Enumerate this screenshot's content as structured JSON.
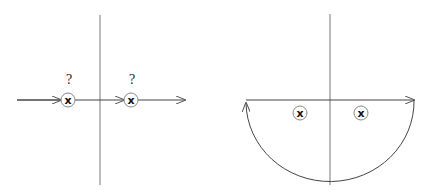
{
  "diagram": {
    "left_panel": {
      "description": "Real-axis integration path passing through two poles",
      "axis_vertical": {
        "x": 100,
        "y1": 15,
        "y2": 185
      },
      "path": {
        "x1": 17,
        "x2": 185,
        "y": 100,
        "arrows_at_x": [
          60,
          123,
          185
        ]
      },
      "poles": [
        {
          "x": 68,
          "y": 100,
          "label": "?",
          "glyph": "x"
        },
        {
          "x": 131,
          "y": 100,
          "label": "?",
          "glyph": "x"
        }
      ]
    },
    "right_panel": {
      "description": "Closed contour: real axis plus lower semicircle, poles below axis",
      "axis_vertical": {
        "x": 330,
        "y1": 14,
        "y2": 185
      },
      "path": {
        "x1": 246,
        "x2": 414,
        "y": 100
      },
      "arc": {
        "cx": 330,
        "cy": 100,
        "r": 84,
        "direction": "lower-half"
      },
      "poles": [
        {
          "x": 300,
          "y": 113,
          "glyph": "x"
        },
        {
          "x": 361,
          "y": 113,
          "glyph": "x"
        }
      ]
    },
    "colors": {
      "line": "#555555",
      "pole_circle": "#888888",
      "glyph": "#111111"
    }
  }
}
